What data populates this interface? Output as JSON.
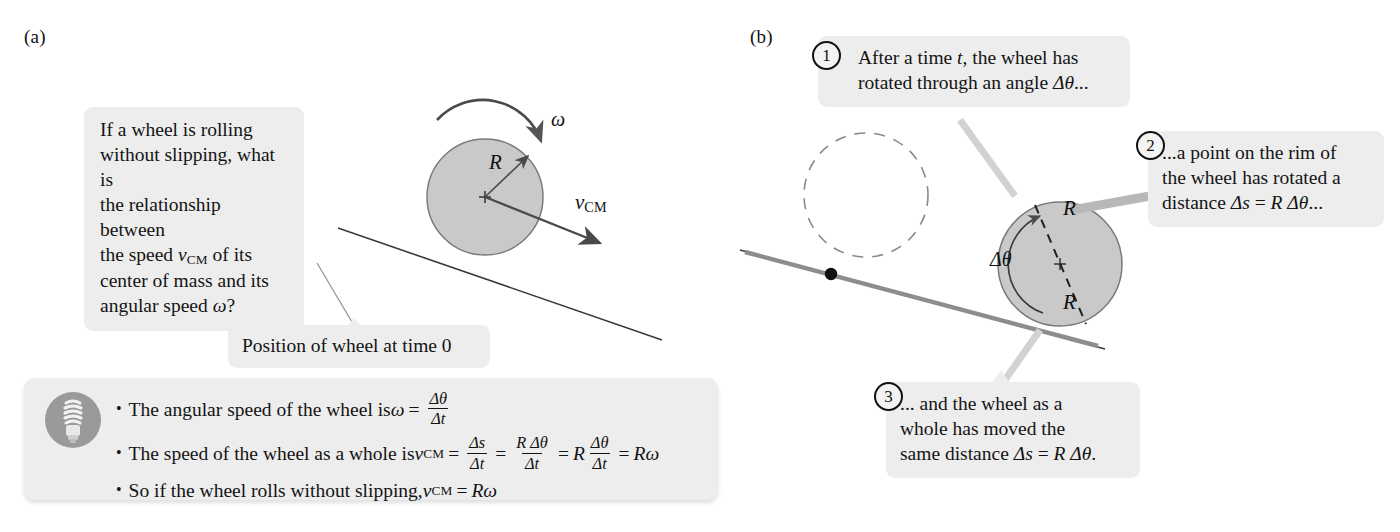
{
  "figure": {
    "panel_a_letter": "(a)",
    "panel_b_letter": "(b)"
  },
  "panel_a": {
    "question_callout": {
      "lines": [
        "If a wheel is rolling",
        "without slipping, what is",
        "the relationship between",
        "the speed v_CM of its",
        "center of mass and its",
        "angular speed ω?"
      ],
      "line1": "If a wheel is rolling",
      "line2": "without slipping, what is",
      "line3": "the relationship between",
      "line4_pre": "the speed ",
      "line4_var": "v",
      "line4_sub": "CM",
      "line4_post": " of its",
      "line5": "center of mass and its",
      "line6_pre": "angular speed ",
      "line6_var": "ω",
      "line6_post": "?"
    },
    "position_callout": "Position of wheel at time 0",
    "wheel_labels": {
      "radius": "R",
      "omega": "ω",
      "velocity_var": "v",
      "velocity_sub": "CM"
    }
  },
  "panel_b": {
    "step1": {
      "number": "1",
      "line1_pre": "After a time ",
      "line1_var": "t",
      "line1_post": ", the wheel has",
      "line2_pre": "rotated through an angle ",
      "line2_var": "Δθ",
      "line2_post": "..."
    },
    "step2": {
      "number": "2",
      "line1": "...a point on the rim of",
      "line2": "the wheel has rotated a",
      "line3_pre": "distance ",
      "line3_var": "Δs",
      "line3_eq": " = ",
      "line3_var2": "R Δθ",
      "line3_post": "..."
    },
    "step3": {
      "number": "3",
      "line1": "... and the wheel as a",
      "line2": "whole has moved the",
      "line3_pre": "same distance ",
      "line3_var": "Δs",
      "line3_eq": " = ",
      "line3_var2": "R Δθ",
      "line3_post": "."
    },
    "wheel_labels": {
      "radius_top": "R",
      "radius_bottom": "R",
      "delta_theta": "Δθ"
    }
  },
  "summary_box": {
    "icon": "lightbulb-icon",
    "bullets": [
      {
        "id": "angular-speed",
        "text_pre": "The angular speed of the wheel is ",
        "symbol": "ω",
        "equals": "=",
        "frac_num": "Δθ",
        "frac_den": "Δt"
      },
      {
        "id": "wheel-speed",
        "text_pre": "The speed of the wheel as a whole is ",
        "symbol": "v",
        "symbol_sub": "CM",
        "equals": "=",
        "f1_num": "Δs",
        "f1_den": "Δt",
        "eq2": "=",
        "f2_num": "R Δθ",
        "f2_den": "Δt",
        "eq3": "=",
        "coef": "R",
        "f3_num": "Δθ",
        "f3_den": "Δt",
        "eq4": "=",
        "result": "Rω"
      },
      {
        "id": "rolling-condition",
        "text_pre": "So if the wheel rolls without slipping, ",
        "symbol": "v",
        "symbol_sub": "CM",
        "equals": "=",
        "result": "Rω"
      }
    ]
  },
  "colors": {
    "callout_bg": "#ededed",
    "wheel_fill": "#c9c9c9",
    "wheel_stroke": "#6f6f6f",
    "line_stroke": "#3a3a3a",
    "arrow_stroke": "#4a4a4a",
    "thick_line": "#8a8a8a",
    "text": "#141414",
    "bulb_circle": "#9a9a9a"
  }
}
